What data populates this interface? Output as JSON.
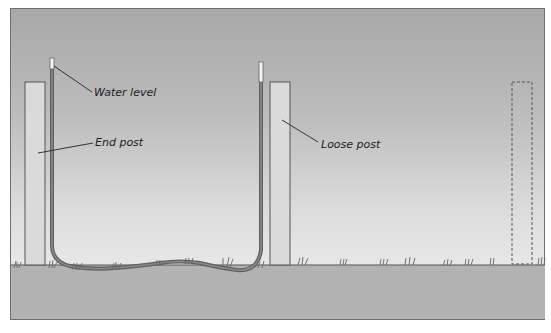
{
  "diagram": {
    "title": "",
    "labels": {
      "water_level": "Water level",
      "end_post": "End post",
      "loose_post": "Loose post"
    },
    "colors": {
      "sky_top": "#a8a8a8",
      "sky_bottom": "#f2f2f2",
      "ground": "#b2b2b2",
      "post_fill": "#d8d8d8",
      "outline": "#555555",
      "tube": "#707070",
      "water_top": "#f4f4f4"
    }
  }
}
